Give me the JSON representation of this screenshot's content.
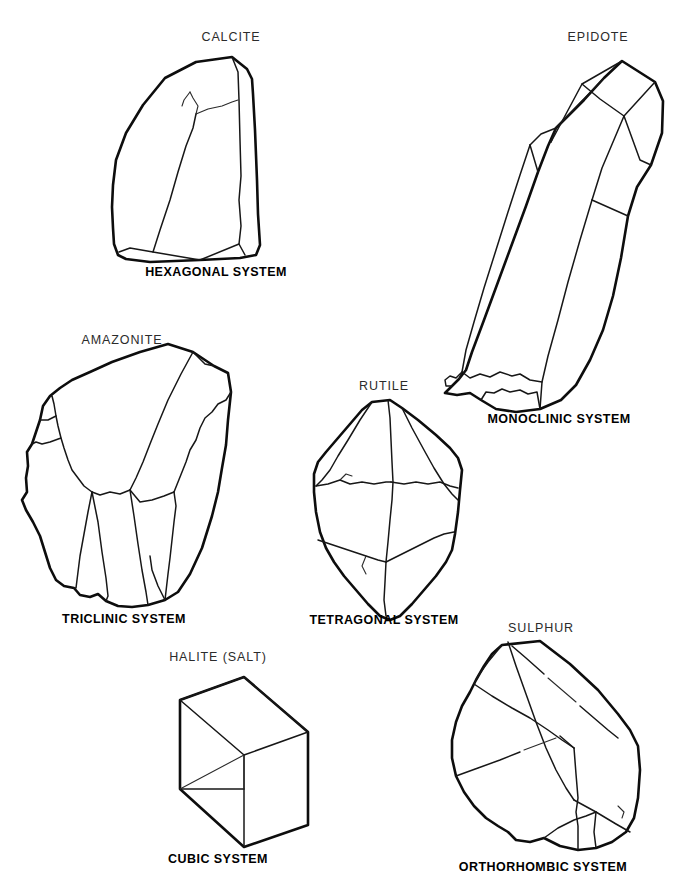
{
  "figure": {
    "background_color": "#ffffff",
    "ink_color": "#0d0d0d",
    "type": "line-drawing-plate",
    "specimen_count": 6
  },
  "specimens": [
    {
      "id": "calcite",
      "mineral_label": "CALCITE",
      "system_label": "HEXAGONAL SYSTEM",
      "position": "top-left",
      "shape": "elongated blocky prism with inclined faces"
    },
    {
      "id": "epidote",
      "mineral_label": "EPIDOTE",
      "system_label": "MONOCLINIC SYSTEM",
      "position": "right-top",
      "shape": "long tilted prism with oblique terminations"
    },
    {
      "id": "amazonite",
      "mineral_label": "AMAZONITE",
      "system_label": "TRICLINIC SYSTEM",
      "position": "left-middle",
      "shape": "stubby tilted block with many unequal faces"
    },
    {
      "id": "rutile",
      "mineral_label": "RUTILE",
      "system_label": "TETRAGONAL SYSTEM",
      "position": "center-middle",
      "shape": "doubly terminated pointed prism"
    },
    {
      "id": "halite",
      "mineral_label": "HALITE (SALT)",
      "system_label": "CUBIC SYSTEM",
      "position": "bottom-center-left",
      "shape": "transparent cube in isometric view"
    },
    {
      "id": "sulphur",
      "mineral_label": "SULPHUR",
      "system_label": "ORTHORHOMBIC SYSTEM",
      "position": "bottom-right",
      "shape": "dipyramidal blocky crystal"
    }
  ]
}
